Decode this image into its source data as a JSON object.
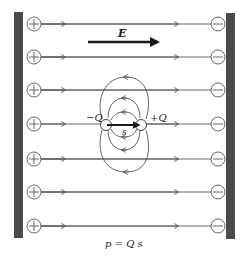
{
  "diagram": {
    "field_label": "E",
    "negative_charge_label": "−Q",
    "positive_charge_label": "+Q",
    "separation_label": "s",
    "formula": "p = Q s",
    "left_plate_charges": [
      "+",
      "+",
      "+",
      "+",
      "+",
      "+",
      "+"
    ],
    "right_plate_charges": [
      "−",
      "−",
      "−",
      "−",
      "−",
      "−",
      "−"
    ],
    "field_line_rows": 7,
    "colors": {
      "plate": "#4a4a4a",
      "line": "#555555",
      "arrow": "#1a1a1a",
      "background": "#ffffff"
    }
  }
}
